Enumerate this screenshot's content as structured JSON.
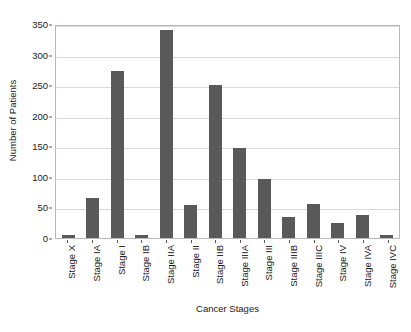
{
  "chart_data": {
    "type": "bar",
    "title": "",
    "xlabel": "Cancer Stages",
    "ylabel": "Number of Patients",
    "categories": [
      "Stage X",
      "Stage IA",
      "Stage I",
      "Stage IB",
      "Stage IIA",
      "Stage II",
      "Stage IIB",
      "Stage IIIA",
      "Stage III",
      "Stage IIIB",
      "Stage IIIC",
      "Stage IV",
      "Stage IVA",
      "Stage IVC"
    ],
    "values": [
      5,
      65,
      273,
      5,
      340,
      54,
      250,
      147,
      97,
      34,
      55,
      24,
      38,
      5
    ],
    "ylim": [
      0,
      350
    ],
    "yticks": [
      0,
      50,
      100,
      150,
      200,
      250,
      300,
      350
    ],
    "ytick_labels": [
      "0",
      "50",
      "100",
      "150",
      "200",
      "250",
      "300",
      "350"
    ],
    "grid": true,
    "legend": false,
    "bar_color": "#595959",
    "grid_color": "#d9d9d9",
    "frame_color": "#b9b9b9"
  }
}
